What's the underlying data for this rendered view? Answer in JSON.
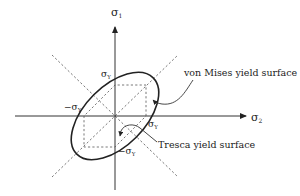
{
  "diagram": {
    "axes": {
      "vertical": {
        "label": "σ",
        "subscript": "1"
      },
      "horizontal": {
        "label": "σ",
        "subscript": "2"
      }
    },
    "tick_labels": {
      "top": {
        "text": "σ",
        "sub": "Y"
      },
      "left": {
        "text": "−σ",
        "sub": "Y"
      },
      "right": {
        "text": "σ",
        "sub": "Y"
      },
      "bottom": {
        "text": "−σ",
        "sub": "Y"
      }
    },
    "annotations": {
      "von_mises": "von Mises yield surface",
      "tresca": "Tresca yield surface"
    },
    "colors": {
      "line": "#222222",
      "dashed": "#555555",
      "background": "#ffffff"
    }
  }
}
